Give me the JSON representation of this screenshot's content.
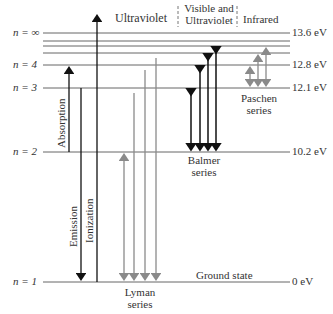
{
  "regions": {
    "ultraviolet": "Ultraviolet",
    "visible_uv_line1": "Visible and",
    "visible_uv_line2": "Ultraviolet",
    "infrared": "Infrared"
  },
  "levels": [
    {
      "n_label": "n = ∞",
      "energy": "13.6 eV"
    },
    {
      "n_label": "n = 4",
      "energy": "12.8 eV"
    },
    {
      "n_label": "n = 3",
      "energy": "12.1 eV"
    },
    {
      "n_label": "n = 2",
      "energy": "10.2 eV"
    },
    {
      "n_label": "n = 1",
      "energy": "0 eV"
    }
  ],
  "labels": {
    "absorption": "Absorption",
    "emission": "Emission",
    "ionization": "Ionization",
    "ground_state": "Ground state",
    "balmer_1": "Balmer",
    "balmer_2": "series",
    "paschen_1": "Paschen",
    "paschen_2": "series",
    "lyman_1": "Lyman",
    "lyman_2": "series"
  },
  "colors": {
    "line": "#555555",
    "black_arrow": "#111111",
    "gray_arrow": "#8a8a8a"
  }
}
